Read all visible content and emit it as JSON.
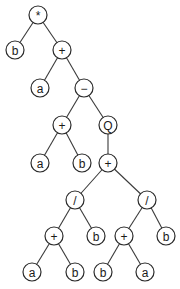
{
  "diagram": {
    "type": "expression-tree",
    "node_radius": 9,
    "colors": {
      "stroke": "#2a2a2a",
      "edge": "#3a3a3a",
      "fill": "#ffffff",
      "text": "#1a1a1a"
    },
    "nodes": [
      {
        "id": "n0",
        "label": "*",
        "x": 38,
        "y": 15
      },
      {
        "id": "n1",
        "label": "b",
        "x": 15,
        "y": 50
      },
      {
        "id": "n2",
        "label": "+",
        "x": 62,
        "y": 50
      },
      {
        "id": "n3",
        "label": "a",
        "x": 40,
        "y": 88
      },
      {
        "id": "n4",
        "label": "−",
        "x": 84,
        "y": 88
      },
      {
        "id": "n5",
        "label": "+",
        "x": 62,
        "y": 125
      },
      {
        "id": "n6",
        "label": "Q",
        "x": 108,
        "y": 125
      },
      {
        "id": "n7",
        "label": "a",
        "x": 40,
        "y": 163
      },
      {
        "id": "n8",
        "label": "b",
        "x": 82,
        "y": 163
      },
      {
        "id": "n9",
        "label": "+",
        "x": 108,
        "y": 163
      },
      {
        "id": "n10",
        "label": "/",
        "x": 75,
        "y": 200
      },
      {
        "id": "n11",
        "label": "/",
        "x": 147,
        "y": 200
      },
      {
        "id": "n12",
        "label": "+",
        "x": 54,
        "y": 236
      },
      {
        "id": "n13",
        "label": "b",
        "x": 96,
        "y": 236
      },
      {
        "id": "n14",
        "label": "+",
        "x": 124,
        "y": 236
      },
      {
        "id": "n15",
        "label": "b",
        "x": 166,
        "y": 236
      },
      {
        "id": "n16",
        "label": "a",
        "x": 32,
        "y": 272
      },
      {
        "id": "n17",
        "label": "b",
        "x": 75,
        "y": 272
      },
      {
        "id": "n18",
        "label": "b",
        "x": 103,
        "y": 272
      },
      {
        "id": "n19",
        "label": "a",
        "x": 145,
        "y": 272
      }
    ],
    "edges": [
      [
        "n0",
        "n1"
      ],
      [
        "n0",
        "n2"
      ],
      [
        "n2",
        "n3"
      ],
      [
        "n2",
        "n4"
      ],
      [
        "n4",
        "n5"
      ],
      [
        "n4",
        "n6"
      ],
      [
        "n5",
        "n7"
      ],
      [
        "n5",
        "n8"
      ],
      [
        "n6",
        "n9"
      ],
      [
        "n9",
        "n10"
      ],
      [
        "n9",
        "n11"
      ],
      [
        "n10",
        "n12"
      ],
      [
        "n10",
        "n13"
      ],
      [
        "n11",
        "n14"
      ],
      [
        "n11",
        "n15"
      ],
      [
        "n12",
        "n16"
      ],
      [
        "n12",
        "n17"
      ],
      [
        "n14",
        "n18"
      ],
      [
        "n14",
        "n19"
      ]
    ]
  }
}
